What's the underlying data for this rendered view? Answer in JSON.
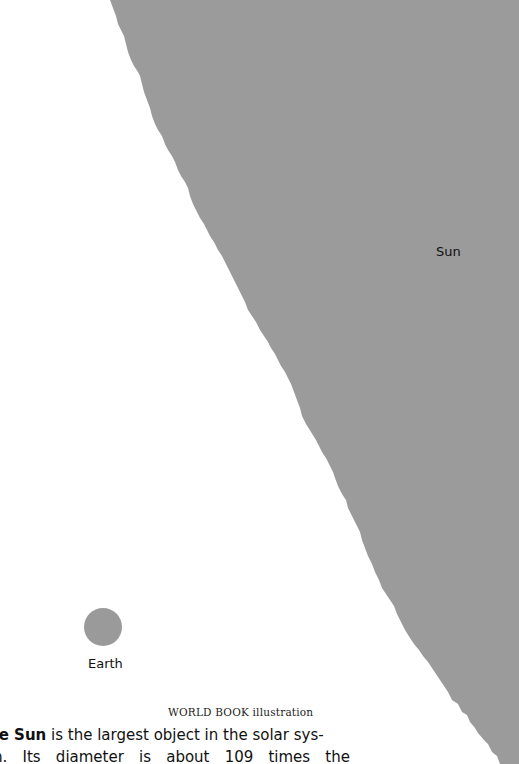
{
  "figure": {
    "sun": {
      "label": "Sun",
      "color": "#9b9b9b"
    },
    "earth": {
      "label": "Earth",
      "color": "#9a9a9a"
    },
    "credit": "WORLD BOOK illustration",
    "caption": {
      "bold_lead": "he Sun",
      "line1_rest": " is the largest object in the solar sys-",
      "line2_words": [
        "m.",
        "Its",
        "diameter",
        "is",
        "about",
        "109",
        "times",
        "the"
      ]
    }
  }
}
